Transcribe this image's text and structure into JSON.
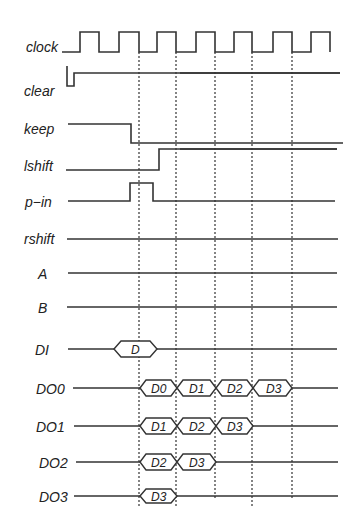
{
  "diagram": {
    "type": "timing-diagram",
    "signals": [
      {
        "name": "clock",
        "label": "clock"
      },
      {
        "name": "clear",
        "label": "clear"
      },
      {
        "name": "keep",
        "label": "keep"
      },
      {
        "name": "lshift",
        "label": "lshift"
      },
      {
        "name": "p-in",
        "label": "p−in"
      },
      {
        "name": "rshift",
        "label": "rshift"
      },
      {
        "name": "A",
        "label": "A"
      },
      {
        "name": "B",
        "label": "B"
      },
      {
        "name": "DI",
        "label": "DI"
      },
      {
        "name": "DO0",
        "label": "DO0"
      },
      {
        "name": "DO1",
        "label": "DO1"
      },
      {
        "name": "DO2",
        "label": "DO2"
      },
      {
        "name": "DO3",
        "label": "DO3"
      }
    ],
    "buses": {
      "DI": [
        "D"
      ],
      "DO0": [
        "D0",
        "D1",
        "D2",
        "D3"
      ],
      "DO1": [
        "D1",
        "D2",
        "D3"
      ],
      "DO2": [
        "D2",
        "D3"
      ],
      "DO3": [
        "D3"
      ]
    },
    "line_color": "#333333",
    "background": "#ffffff"
  }
}
